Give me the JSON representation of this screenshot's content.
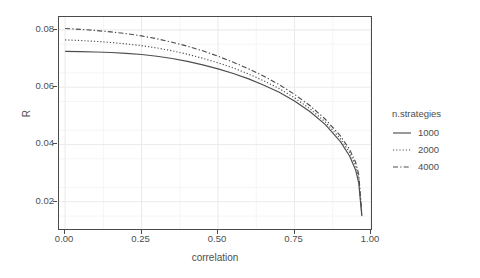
{
  "chart_data": {
    "type": "line",
    "title": "",
    "xlabel": "correlation",
    "ylabel": "R",
    "xlim": [
      -0.02,
      1.0
    ],
    "ylim": [
      0.0105,
      0.0845
    ],
    "xticks": [
      "0.00",
      "0.25",
      "0.50",
      "0.75",
      "1.00"
    ],
    "xtick_values": [
      0.0,
      0.25,
      0.5,
      0.75,
      1.0
    ],
    "yticks": [
      "0.02",
      "0.04",
      "0.06",
      "0.08"
    ],
    "ytick_values": [
      0.02,
      0.04,
      0.06,
      0.08
    ],
    "grid": true,
    "grid_minor": true,
    "legend_position": "right",
    "legend_title": "n.strategies",
    "x": [
      0.0,
      0.05,
      0.1,
      0.15,
      0.2,
      0.25,
      0.3,
      0.35,
      0.4,
      0.45,
      0.5,
      0.55,
      0.6,
      0.65,
      0.7,
      0.75,
      0.8,
      0.85,
      0.9,
      0.93,
      0.95,
      0.96,
      0.97
    ],
    "series": [
      {
        "name": "1000",
        "style": "solid",
        "color": "#4d4d4d",
        "values": [
          0.0725,
          0.0724,
          0.0723,
          0.0721,
          0.0718,
          0.0714,
          0.0708,
          0.07,
          0.069,
          0.0678,
          0.0664,
          0.0648,
          0.0629,
          0.0607,
          0.0582,
          0.0552,
          0.0515,
          0.047,
          0.041,
          0.036,
          0.031,
          0.0265,
          0.015
        ]
      },
      {
        "name": "2000",
        "style": "dotted",
        "color": "#4d4d4d",
        "values": [
          0.0765,
          0.0763,
          0.076,
          0.0756,
          0.0751,
          0.0745,
          0.0737,
          0.0727,
          0.0715,
          0.0701,
          0.0685,
          0.0667,
          0.0646,
          0.0622,
          0.0595,
          0.0563,
          0.0525,
          0.0479,
          0.042,
          0.0372,
          0.0325,
          0.0282,
          0.0155
        ]
      },
      {
        "name": "4000",
        "style": "dashdot",
        "color": "#4d4d4d",
        "values": [
          0.0805,
          0.0802,
          0.0798,
          0.0793,
          0.0787,
          0.0779,
          0.0769,
          0.0757,
          0.0743,
          0.0727,
          0.0708,
          0.0687,
          0.0664,
          0.0638,
          0.0609,
          0.0575,
          0.0536,
          0.0489,
          0.043,
          0.0383,
          0.0337,
          0.0295,
          0.016
        ]
      }
    ]
  },
  "colors": {
    "panel_background": "#ffffff",
    "panel_border": "#4a4a4a",
    "grid_major": "#ebebeb",
    "grid_minor": "#f5f5f5",
    "line": "#4d4d4d",
    "text": "#4d4d4d"
  },
  "legend": {
    "title": "n.strategies",
    "items": [
      {
        "label": "1000",
        "style": "solid"
      },
      {
        "label": "2000",
        "style": "dotted"
      },
      {
        "label": "4000",
        "style": "dashdot"
      }
    ]
  },
  "axes": {
    "x_title": "correlation",
    "y_title": "R"
  }
}
